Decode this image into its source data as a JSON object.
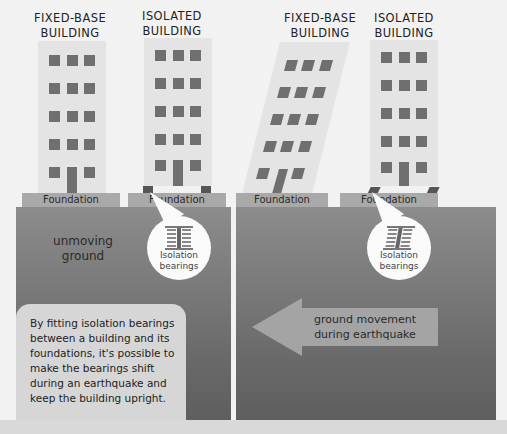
{
  "panels": {
    "left": {
      "fixed_building_title": [
        "FIXED-BASE",
        "BUILDING"
      ],
      "isolated_building_title": [
        "ISOLATED",
        "BUILDING"
      ],
      "foundation_labels": [
        "Foundation",
        "Foundation"
      ],
      "ground_label": [
        "unmoving",
        "ground"
      ],
      "bearing_callout": [
        "Isolation",
        "bearings"
      ]
    },
    "right": {
      "fixed_building_title": [
        "FIXED-BASE",
        "BUILDING"
      ],
      "isolated_building_title": [
        "ISOLATED",
        "BUILDING"
      ],
      "foundation_labels": [
        "Foundation",
        "Foundation"
      ],
      "arrow_label": [
        "ground movement",
        "during earthquake"
      ],
      "bearing_callout": [
        "Isolation",
        "bearings"
      ]
    }
  },
  "info_box": {
    "text": "By fitting isolation bearings between a building and its foundations, it's possible to make the bearings shift during an earthquake and keep the building upright."
  },
  "colors": {
    "background": "#f2f2f2",
    "ground": "#7a7a7a",
    "building": "#e4e4e4",
    "window": "#6f6f6f",
    "foundation": "#a9a9a9",
    "bubble": "#fafafa"
  }
}
